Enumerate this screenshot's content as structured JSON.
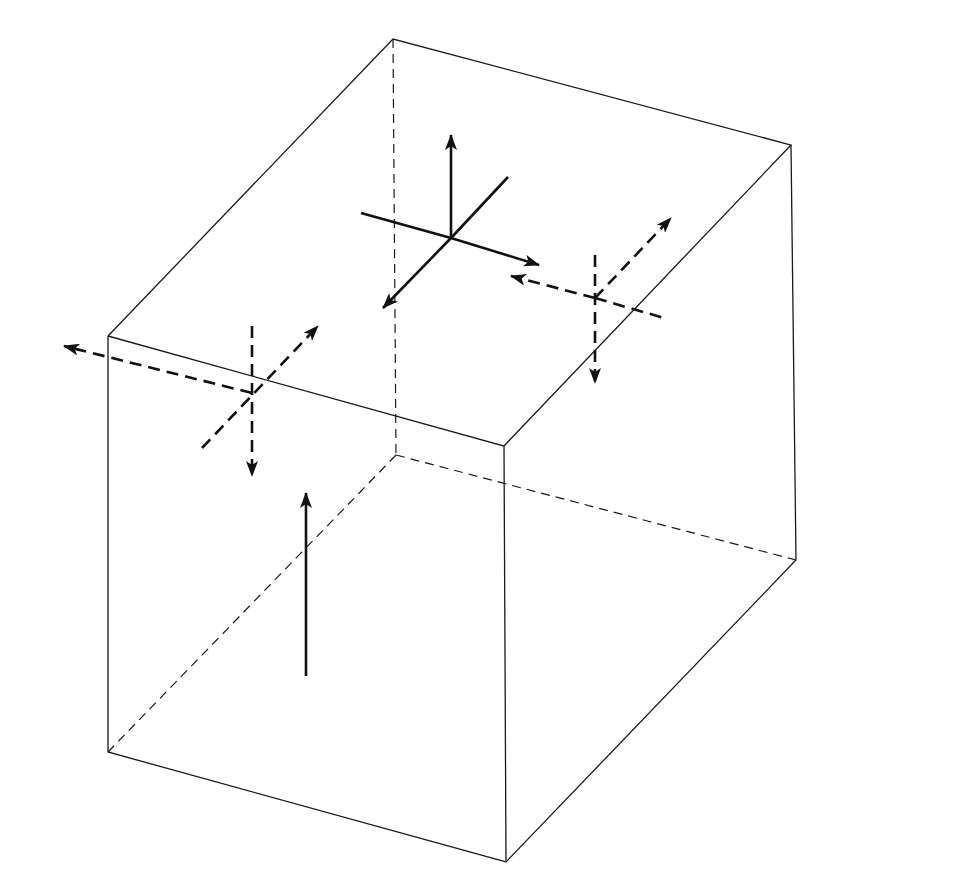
{
  "diagram": {
    "volume_label": "dV",
    "body_forces": {
      "fx": "f",
      "fx_sub": "x",
      "fy": "f",
      "fy_sub": "y",
      "fz": "f",
      "fz_sub": "z",
      "dV": "dV"
    },
    "top_face": {
      "normal": {
        "sym": "σ",
        "sub": "z",
        "plus": "+",
        "num": "∂σ",
        "num_sub": "z",
        "den": "∂z",
        "tail": "dz"
      },
      "shear_y": {
        "sym": "τ",
        "sub": "yz",
        "plus": "+",
        "num": "∂τ",
        "num_sub": "yz",
        "den": "∂z",
        "tail": "dz"
      },
      "shear_x": {
        "sym": "τ",
        "sub": "xz",
        "plus": "+",
        "num": "∂τ",
        "num_sub": "xz",
        "den": "∂z",
        "tail": "dz"
      }
    },
    "back_face_x": {
      "normal": {
        "sym": "σ",
        "sub": "x"
      },
      "shear_y": {
        "sym": "τ",
        "sub": "xy"
      },
      "shear_z": {
        "sym": "τ",
        "sub": "xz"
      }
    },
    "left_face_y": {
      "normal": {
        "sym": "σ",
        "sub": "y"
      },
      "shear_x": {
        "sym": "τ",
        "sub": "xy"
      },
      "shear_z": {
        "sym": "τ",
        "sub": "yz"
      }
    },
    "right_face_y": {
      "normal": {
        "sym": "σ",
        "sub": "y",
        "plus": "+",
        "num": "∂σ",
        "num_sub": "y",
        "den": "∂y",
        "tail": "dy"
      },
      "shear_z": {
        "sym": "τ",
        "sub": "yz",
        "plus": "+",
        "num": "∂τ",
        "num_sub": "yz",
        "den": "∂y",
        "tail": "dy"
      },
      "shear_x": {
        "sym": "τ",
        "sub": "xy",
        "plus": "+",
        "num": "∂τ",
        "num_sub": "xy",
        "den": "∂y",
        "tail": "dy"
      }
    },
    "front_face_x": {
      "normal": {
        "sym": "σ",
        "sub": "x",
        "plus": "+",
        "num": "∂σ",
        "num_sub": "x",
        "den": "∂x",
        "tail": "dx"
      },
      "shear_z": {
        "sym": "τ",
        "sub": "xz",
        "plus": "+",
        "num": "∂τ",
        "num_sub": "xz",
        "den": "∂x",
        "tail": "dx"
      },
      "shear_y": {
        "sym": "τ",
        "sub": "xy",
        "plus": "+",
        "num": "∂τ",
        "num_sub": "xy",
        "den": "∂x",
        "tail": "dx"
      }
    },
    "bottom_face_z": {
      "normal": {
        "sym": "σ",
        "sub": "z"
      },
      "shear_y": {
        "sym": "τ",
        "sub": "yz"
      },
      "shear_x": {
        "sym": "τ",
        "sub": "xz"
      }
    },
    "colors": {
      "line": "#1a1a1a",
      "body_force_fill": "#a8a8a8",
      "background": "#ffffff"
    }
  }
}
